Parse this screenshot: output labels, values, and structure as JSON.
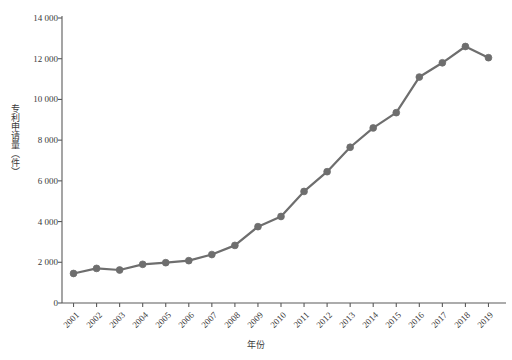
{
  "chart_data": {
    "type": "line",
    "title": "",
    "xlabel": "年份",
    "ylabel": "专利申请量（件）",
    "categories": [
      "2001",
      "2002",
      "2003",
      "2004",
      "2005",
      "2006",
      "2007",
      "2008",
      "2009",
      "2010",
      "2011",
      "2012",
      "2013",
      "2014",
      "2015",
      "2016",
      "2017",
      "2018",
      "2019"
    ],
    "values": [
      1450,
      1700,
      1620,
      1900,
      1980,
      2080,
      2380,
      2830,
      3750,
      4250,
      5480,
      6450,
      7650,
      8600,
      9350,
      11100,
      11800,
      12600,
      12050
    ],
    "series": [
      {
        "name": "专利申请量",
        "values": [
          1450,
          1700,
          1620,
          1900,
          1980,
          2080,
          2380,
          2830,
          3750,
          4250,
          5480,
          6450,
          7650,
          8600,
          9350,
          11100,
          11800,
          12600,
          12050
        ]
      }
    ],
    "ylim": [
      0,
      14000
    ],
    "ytick_values": [
      0,
      2000,
      4000,
      6000,
      8000,
      10000,
      12000,
      14000
    ],
    "ytick_labels": [
      "0",
      "2 000",
      "4 000",
      "6 000",
      "8 000",
      "10 000",
      "12 000",
      "14 000"
    ],
    "grid": false,
    "legend": "none",
    "line_color": "#6e6e6e",
    "marker_color": "#6e6e6e",
    "marker_shape": "circle",
    "axis_color": "#5a5a5a"
  },
  "caption": {
    "text": ""
  }
}
